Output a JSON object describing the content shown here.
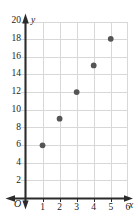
{
  "chart_data": {
    "type": "scatter",
    "title": "",
    "subtitle": "",
    "xlabel": "x",
    "ylabel": "y",
    "origin_label": "O",
    "x": [
      1,
      2,
      3,
      4,
      5
    ],
    "values": [
      6,
      9,
      12,
      15,
      18
    ],
    "points": [
      {
        "x": 1,
        "y": 6
      },
      {
        "x": 2,
        "y": 9
      },
      {
        "x": 3,
        "y": 12
      },
      {
        "x": 4,
        "y": 15
      },
      {
        "x": 5,
        "y": 18
      }
    ],
    "series": [
      {
        "name": "",
        "x": [
          1,
          2,
          3,
          4,
          5
        ],
        "values": [
          6,
          9,
          12,
          15,
          18
        ]
      }
    ],
    "xlim": [
      0,
      6.8
    ],
    "ylim": [
      0,
      21.5
    ],
    "x_ticks": [
      1,
      2,
      3,
      4,
      5,
      6
    ],
    "x_tick_labels": [
      "1",
      "2",
      "3",
      "4",
      "5",
      "6"
    ],
    "y_ticks": [
      2,
      4,
      6,
      8,
      10,
      12,
      14,
      16,
      18,
      20
    ],
    "y_tick_labels": [
      "2",
      "4",
      "6",
      "8",
      "10",
      "12",
      "14",
      "16",
      "18",
      "20"
    ],
    "grid": true,
    "legend": false,
    "legend_position": "none",
    "annotations": [],
    "colors": {
      "point": "#555555",
      "axis": "#2b2b2b",
      "grid": "#d8d8d8",
      "background": "#ffffff",
      "text": "#1a1a1a"
    },
    "marker": {
      "shape": "circle",
      "radius": 2.9
    }
  }
}
